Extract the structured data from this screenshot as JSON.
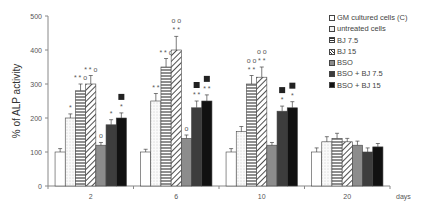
{
  "chart_data": {
    "type": "bar",
    "title": "",
    "xlabel": "days",
    "ylabel": "% of ALP activity",
    "ylim": [
      0,
      500
    ],
    "yticks": [
      0,
      100,
      200,
      300,
      400,
      500
    ],
    "grid": false,
    "legend_position": "right",
    "categories": [
      "2",
      "6",
      "10",
      "20"
    ],
    "series": [
      {
        "name": "GM cultured cells (C)",
        "fill": "#ffffff",
        "pattern": "none",
        "values": [
          100,
          100,
          100,
          100
        ],
        "errors": [
          10,
          8,
          10,
          12
        ],
        "annotations": [
          "",
          "",
          "",
          ""
        ]
      },
      {
        "name": "untreated cells",
        "fill": "#f2f2f2",
        "pattern": "dots",
        "values": [
          200,
          250,
          160,
          130
        ],
        "errors": [
          12,
          22,
          15,
          15
        ],
        "annotations": [
          "*",
          "* *",
          "",
          ""
        ]
      },
      {
        "name": "BJ 7.5",
        "fill": "#ffffff",
        "pattern": "hlines",
        "values": [
          280,
          350,
          300,
          140
        ],
        "errors": [
          20,
          25,
          25,
          15
        ],
        "annotations": [
          "* * o",
          "* * o",
          "o o|* *",
          ""
        ]
      },
      {
        "name": "BJ 15",
        "fill": "#ffffff",
        "pattern": "diag",
        "values": [
          300,
          400,
          320,
          130
        ],
        "errors": [
          25,
          40,
          30,
          10
        ],
        "annotations": [
          "* * o",
          "o o|* *",
          "o o|* *",
          ""
        ]
      },
      {
        "name": "BSO",
        "fill": "#8c8c8c",
        "pattern": "none",
        "values": [
          120,
          140,
          120,
          120
        ],
        "errors": [
          8,
          10,
          8,
          12
        ],
        "annotations": [
          "o",
          "o",
          "",
          ""
        ]
      },
      {
        "name": "BSO + BJ 7.5",
        "fill": "#3d3d3d",
        "pattern": "none",
        "values": [
          180,
          230,
          220,
          100
        ],
        "errors": [
          15,
          20,
          15,
          12
        ],
        "annotations": [
          "*",
          "■|* *",
          "■|*",
          ""
        ]
      },
      {
        "name": "BSO + BJ 15",
        "fill": "#111111",
        "pattern": "none",
        "values": [
          200,
          250,
          230,
          115
        ],
        "errors": [
          15,
          18,
          18,
          10
        ],
        "annotations": [
          "■|*",
          "■|* *",
          "■|*",
          ""
        ]
      }
    ]
  }
}
